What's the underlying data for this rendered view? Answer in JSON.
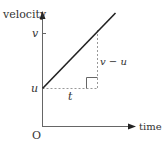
{
  "diagram": {
    "type": "velocity-time graph",
    "y_axis_label": "velocity",
    "x_axis_label": "time",
    "origin_label": "O",
    "tick_v": "v",
    "tick_u": "u",
    "rise_label": "v − u",
    "run_label": "t",
    "colors": {
      "line": "#222222",
      "axis": "#555555",
      "dashed": "#888888",
      "text": "#333333"
    }
  }
}
